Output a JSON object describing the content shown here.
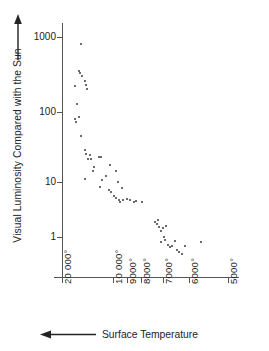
{
  "chart_data": {
    "type": "scatter",
    "title": "",
    "xlabel": "Surface Temperature",
    "ylabel": "Visual Luminosity Compared with the Sun",
    "xlabel_arrow": "left-arrow",
    "ylabel_arrow": "up-arrow",
    "x_axis": {
      "scale": "log-reversed",
      "unit": "degrees",
      "direction": "decreasing left to right",
      "tick_labels": [
        "20 000°",
        "10 000°",
        "9000°",
        "8000°",
        "7000°",
        "6000°",
        "5000°"
      ],
      "tick_values": [
        20000,
        10000,
        9000,
        8000,
        7000,
        6000,
        5000
      ],
      "tick_px": [
        0,
        51,
        65,
        79,
        101,
        127,
        166
      ],
      "xlim": [
        20000,
        4500
      ]
    },
    "y_axis": {
      "scale": "log",
      "tick_labels": [
        "1000",
        "100",
        "10",
        "1"
      ],
      "tick_values": [
        1000,
        100,
        10,
        1
      ],
      "tick_px": [
        7,
        82,
        152,
        207
      ],
      "ylim": [
        0.4,
        2000
      ]
    },
    "grid": false,
    "legend": null,
    "series": [
      {
        "name": "stars",
        "marker": "dot",
        "color": "#3a3a3a",
        "n_points": 61,
        "points_px": [
          [
            19,
            14
          ],
          [
            17,
            41
          ],
          [
            18,
            43
          ],
          [
            20,
            46
          ],
          [
            23,
            51
          ],
          [
            24,
            55
          ],
          [
            13,
            56
          ],
          [
            25,
            59
          ],
          [
            15,
            74
          ],
          [
            17,
            87
          ],
          [
            13,
            89
          ],
          [
            14,
            92
          ],
          [
            19,
            106
          ],
          [
            23,
            120
          ],
          [
            24,
            124
          ],
          [
            26,
            129
          ],
          [
            28,
            125
          ],
          [
            29,
            129
          ],
          [
            37,
            127
          ],
          [
            39,
            127
          ],
          [
            32,
            137
          ],
          [
            31,
            141
          ],
          [
            48,
            135
          ],
          [
            54,
            141
          ],
          [
            23,
            149
          ],
          [
            40,
            150
          ],
          [
            44,
            146
          ],
          [
            38,
            157
          ],
          [
            56,
            152
          ],
          [
            47,
            160
          ],
          [
            49,
            162
          ],
          [
            60,
            158
          ],
          [
            52,
            166
          ],
          [
            54,
            168
          ],
          [
            57,
            170
          ],
          [
            58,
            172
          ],
          [
            61,
            170
          ],
          [
            65,
            169
          ],
          [
            68,
            170
          ],
          [
            72,
            172
          ],
          [
            74,
            171
          ],
          [
            80,
            172
          ],
          [
            93,
            192
          ],
          [
            95,
            194
          ],
          [
            96,
            190
          ],
          [
            97,
            197
          ],
          [
            99,
            201
          ],
          [
            101,
            198
          ],
          [
            104,
            196
          ],
          [
            102,
            207
          ],
          [
            103,
            210
          ],
          [
            99,
            212
          ],
          [
            106,
            215
          ],
          [
            108,
            217
          ],
          [
            110,
            216
          ],
          [
            113,
            211
          ],
          [
            115,
            220
          ],
          [
            117,
            222
          ],
          [
            120,
            224
          ],
          [
            123,
            216
          ],
          [
            139,
            212
          ]
        ],
        "data_values": [
          {
            "temperature": 20000,
            "luminosity": 800
          },
          {
            "temperature": 15500,
            "luminosity": 380
          },
          {
            "temperature": 15300,
            "luminosity": 360
          },
          {
            "temperature": 15000,
            "luminosity": 330
          },
          {
            "temperature": 14600,
            "luminosity": 290
          },
          {
            "temperature": 14400,
            "luminosity": 250
          },
          {
            "temperature": 16500,
            "luminosity": 245
          },
          {
            "temperature": 14200,
            "luminosity": 215
          },
          {
            "temperature": 16100,
            "luminosity": 115
          },
          {
            "temperature": 15600,
            "luminosity": 66
          },
          {
            "temperature": 16500,
            "luminosity": 61
          },
          {
            "temperature": 16300,
            "luminosity": 56
          },
          {
            "temperature": 15200,
            "luminosity": 32
          },
          {
            "temperature": 14500,
            "luminosity": 21
          },
          {
            "temperature": 14300,
            "luminosity": 19
          },
          {
            "temperature": 14000,
            "luminosity": 17
          },
          {
            "temperature": 13600,
            "luminosity": 19
          },
          {
            "temperature": 13400,
            "luminosity": 17
          },
          {
            "temperature": 12000,
            "luminosity": 18
          },
          {
            "temperature": 11800,
            "luminosity": 18
          },
          {
            "temperature": 13000,
            "luminosity": 14
          },
          {
            "temperature": 13100,
            "luminosity": 13
          },
          {
            "temperature": 10500,
            "luminosity": 19
          },
          {
            "temperature": 9900,
            "luminosity": 16
          },
          {
            "temperature": 14500,
            "luminosity": 11
          },
          {
            "temperature": 11700,
            "luminosity": 11
          },
          {
            "temperature": 11200,
            "luminosity": 12
          },
          {
            "temperature": 11900,
            "luminosity": 9.2
          },
          {
            "temperature": 9700,
            "luminosity": 13
          },
          {
            "temperature": 10700,
            "luminosity": 8.6
          },
          {
            "temperature": 10500,
            "luminosity": 8.2
          },
          {
            "temperature": 9400,
            "luminosity": 9.6
          },
          {
            "temperature": 10200,
            "luminosity": 7.4
          },
          {
            "temperature": 9900,
            "luminosity": 7.0
          },
          {
            "temperature": 9600,
            "luminosity": 6.6
          },
          {
            "temperature": 9500,
            "luminosity": 6.3
          },
          {
            "temperature": 9300,
            "luminosity": 6.6
          },
          {
            "temperature": 8900,
            "luminosity": 6.8
          },
          {
            "temperature": 8600,
            "luminosity": 6.6
          },
          {
            "temperature": 8200,
            "luminosity": 6.2
          },
          {
            "temperature": 8100,
            "luminosity": 6.4
          },
          {
            "temperature": 7500,
            "luminosity": 6.2
          },
          {
            "temperature": 6500,
            "luminosity": 2.4
          },
          {
            "temperature": 6400,
            "luminosity": 2.3
          },
          {
            "temperature": 6380,
            "luminosity": 2.6
          },
          {
            "temperature": 6350,
            "luminosity": 2.0
          },
          {
            "temperature": 6280,
            "luminosity": 1.7
          },
          {
            "temperature": 6230,
            "luminosity": 1.8
          },
          {
            "temperature": 6100,
            "luminosity": 1.9
          },
          {
            "temperature": 6200,
            "luminosity": 1.4
          },
          {
            "temperature": 6180,
            "luminosity": 1.3
          },
          {
            "temperature": 6300,
            "luminosity": 1.2
          },
          {
            "temperature": 6050,
            "luminosity": 1.1
          },
          {
            "temperature": 5980,
            "luminosity": 1.0
          },
          {
            "temperature": 5920,
            "luminosity": 1.05
          },
          {
            "temperature": 5820,
            "luminosity": 1.3
          },
          {
            "temperature": 5760,
            "luminosity": 0.86
          },
          {
            "temperature": 5700,
            "luminosity": 0.79
          },
          {
            "temperature": 5620,
            "luminosity": 0.72
          },
          {
            "temperature": 5540,
            "luminosity": 1.2
          },
          {
            "temperature": 5000,
            "luminosity": 1.3
          }
        ]
      }
    ]
  }
}
